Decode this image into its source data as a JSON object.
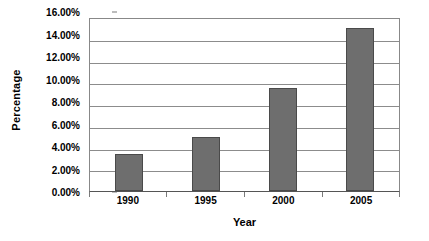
{
  "chart_data": {
    "type": "bar",
    "title": "",
    "subtitle": "",
    "categories": [
      "1990",
      "1995",
      "2000",
      "2005"
    ],
    "values": [
      3.4,
      5.0,
      9.6,
      15.2
    ],
    "series": [
      {
        "name": "Percentage",
        "values": [
          3.4,
          5.0,
          9.6,
          15.2
        ]
      }
    ],
    "xlabel": "Year",
    "ylabel": "Percentage",
    "ylim": [
      0,
      16
    ],
    "ytick_values": [
      0,
      2,
      4,
      6,
      8,
      10,
      12,
      14,
      16
    ],
    "ytick_labels": [
      "0.00%",
      "2.00%",
      "4.00%",
      "6.00%",
      "8.00%",
      "10.00%",
      "12.00%",
      "14.00%",
      "16.00%"
    ],
    "value_format": "percent",
    "grid": "horizontal",
    "legend": "none",
    "legend_position": "none",
    "bar_color": "#6E6E6E",
    "bar_border_color": "#4A4A4A",
    "gridline_color": "#8C8C8C",
    "axis_color": "#555555",
    "background_color": "#FFFFFF",
    "text_color": "#000000"
  }
}
